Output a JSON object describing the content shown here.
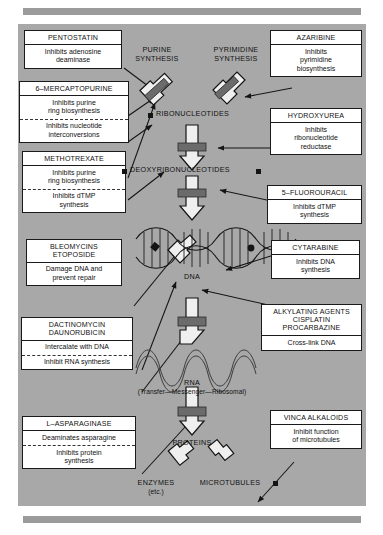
{
  "figure": {
    "background_color": "#a8a8a8",
    "box_fill": "#ffffff",
    "rule_color": "#9b9b9b",
    "ink_color": "#141414"
  },
  "drug_boxes": [
    {
      "id": "pentostatin",
      "name": "PENTOSTATIN",
      "effects": [
        "Inhibits adenosine\ndeaminase"
      ],
      "divider_dashed": false
    },
    {
      "id": "6-mercaptopurine",
      "name": "6–MERCAPTOPURINE",
      "effects": [
        "Inhibits purine\nring biosynthesis",
        "Inhibits nucleotide\ninterconversions"
      ],
      "divider_dashed": true
    },
    {
      "id": "methotrexate",
      "name": "METHOTREXATE",
      "effects": [
        "Inhibits purine\nring biosynthesis",
        "Inhibits dTMP\nsynthesis"
      ],
      "divider_dashed": true
    },
    {
      "id": "bleomycins-etoposide",
      "name": "BLEOMYCINS\nETOPOSIDE",
      "effects": [
        "Damage DNA and\nprevent repair"
      ],
      "divider_dashed": false
    },
    {
      "id": "dactinomycin-daunorubicin",
      "name": "DACTINOMYCIN\nDAUNORUBICIN",
      "effects": [
        "Intercalate with DNA",
        "Inhibit RNA synthesis"
      ],
      "divider_dashed": true
    },
    {
      "id": "l-asparaginase",
      "name": "L–ASPARAGINASE",
      "effects": [
        "Deaminates asparagine",
        "Inhibits protein\nsynthesis"
      ],
      "divider_dashed": true
    },
    {
      "id": "azaribine",
      "name": "AZARIBINE",
      "effects": [
        "Inhibits\npyrimidine\nbiosynthesis"
      ],
      "divider_dashed": false
    },
    {
      "id": "hydroxyurea",
      "name": "HYDROXYUREA",
      "effects": [
        "Inhibits\nribonucleotide\nreductase"
      ],
      "divider_dashed": false
    },
    {
      "id": "5-fluorouracil",
      "name": "5–FLUOROURACIL",
      "effects": [
        "Inhibits dTMP\nsynthesis"
      ],
      "divider_dashed": false
    },
    {
      "id": "cytarabine",
      "name": "CYTARABINE",
      "effects": [
        "Inhibits DNA\nsynthesis"
      ],
      "divider_dashed": false
    },
    {
      "id": "alkylating-agents",
      "name": "ALKYLATING AGENTS\nCISPLATIN\nPROCARBAZINE",
      "effects": [
        "Cross-link DNA"
      ],
      "divider_dashed": false
    },
    {
      "id": "vinca-alkaloids",
      "name": "VINCA ALKALOIDS",
      "effects": [
        "Inhibit function\nof microtubules"
      ],
      "divider_dashed": false
    }
  ],
  "pathway_labels": {
    "purine_synthesis": "PURINE\nSYNTHESIS",
    "pyrimidine_synthesis": "PYRIMIDINE\nSYNTHESIS",
    "ribonucleotides": "RIBONUCLEOTIDES",
    "deoxyribonucleotides": "DEOXYRIBONUCLEOTIDES",
    "dna": "DNA",
    "rna": "RNA",
    "rna_sub": "(Transfer—Messenger—Ribosomal)",
    "proteins": "PROTEINS",
    "enzymes": "ENZYMES",
    "enzymes_sub": "(etc.)",
    "microtubules": "MICROTUBULES"
  }
}
